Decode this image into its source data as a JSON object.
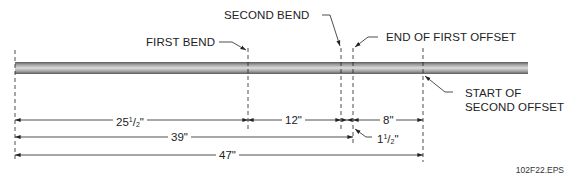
{
  "labels": {
    "first_bend": "FIRST BEND",
    "second_bend": "SECOND BEND",
    "end_first_offset": "END OF FIRST OFFSET",
    "start_second_offset_line1": "START OF",
    "start_second_offset_line2": "SECOND OFFSET"
  },
  "dimensions": {
    "d1": {
      "whole": "25",
      "num": "1",
      "den": "2",
      "unit": "\""
    },
    "d2": {
      "text": "12\""
    },
    "d3": {
      "text": "8\""
    },
    "d4": {
      "whole": "1",
      "num": "1",
      "den": "2",
      "unit": "\""
    },
    "d5": {
      "text": "39\""
    },
    "d6": {
      "text": "47\""
    }
  },
  "figure_id": "102F22.EPS",
  "colors": {
    "line": "#222222",
    "pipe_dark": "#6a6a6a",
    "pipe_light": "#d8d8d8"
  }
}
